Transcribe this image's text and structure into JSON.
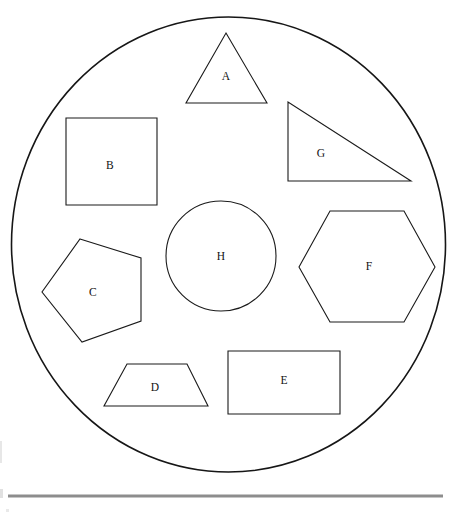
{
  "page": {
    "background_color": "#ffffff",
    "width": 467,
    "height": 521
  },
  "enclosure": {
    "name": "large-circle",
    "shape": "ellipse",
    "center_x": 228.5,
    "center_y": 244.5,
    "radius_x": 217,
    "radius_y": 227.5,
    "stroke_color": "#161616",
    "stroke_width": 1.6,
    "fill": "none"
  },
  "divider": {
    "name": "horizontal-rule",
    "x1": 8,
    "y1": 496,
    "x2": 443,
    "y2": 496,
    "color": "#8d8d8d",
    "thickness": 3
  },
  "styles": {
    "shape_stroke_color": "#1a1a1a",
    "shape_stroke_width": 1.1,
    "label_color": "#111111",
    "label_font_size": 11.5
  },
  "shapes": [
    {
      "label": "A",
      "name": "triangle-a",
      "kind": "triangle",
      "points": "226,33 267,103 186,103",
      "label_x": 226,
      "label_y": 77,
      "position": "top-center"
    },
    {
      "label": "B",
      "name": "square-b",
      "kind": "square",
      "points": "66,118 157,118 157,205 66,205",
      "label_x": 110,
      "label_y": 166,
      "position": "upper-left"
    },
    {
      "label": "C",
      "name": "pentagon-c",
      "kind": "pentagon",
      "points": "80,239 141,258 141,321 82,342 42,292",
      "label_x": 93,
      "label_y": 293,
      "position": "left"
    },
    {
      "label": "D",
      "name": "trapezoid-d",
      "kind": "trapezoid",
      "points": "127,364 187,364 208,406 104,406",
      "label_x": 155,
      "label_y": 388,
      "position": "bottom-left"
    },
    {
      "label": "E",
      "name": "rectangle-e",
      "kind": "rectangle",
      "points": "228,351 340,351 340,414 228,414",
      "label_x": 284,
      "label_y": 381,
      "position": "bottom-right"
    },
    {
      "label": "F",
      "name": "hexagon-f",
      "kind": "hexagon",
      "points": "330,211 404,211 435,267 404,322 330,322 299,267",
      "label_x": 369,
      "label_y": 267,
      "position": "right"
    },
    {
      "label": "G",
      "name": "right-triangle-g",
      "kind": "right-triangle",
      "points": "288,102 288,181 411,181",
      "label_x": 321,
      "label_y": 154,
      "position": "upper-right"
    },
    {
      "label": "H",
      "name": "circle-h",
      "kind": "circle",
      "center_x": 221,
      "center_y": 256,
      "radius": 55,
      "label_x": 221,
      "label_y": 257,
      "position": "center"
    }
  ]
}
